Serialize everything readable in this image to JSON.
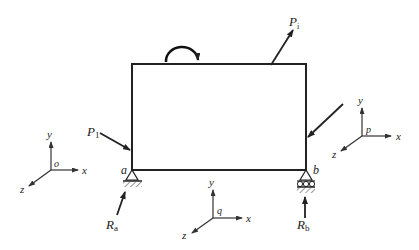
{
  "diagram": {
    "type": "free-body diagram of a rigid body with supports and coordinate frames",
    "body": {
      "shape": "rectangle",
      "corner_labels": {
        "bottom_left": "a",
        "bottom_right": "b"
      }
    },
    "forces": [
      {
        "id": "P1",
        "label": "P",
        "subscript": "1",
        "position": "left side near bottom"
      },
      {
        "id": "Pi",
        "label": "P",
        "subscript": "i",
        "position": "top edge, pointing up-right"
      },
      {
        "id": "unnamed",
        "label": "",
        "position": "right side, pointing down-left"
      },
      {
        "id": "Ra",
        "label": "R",
        "subscript": "a",
        "position": "below support a"
      },
      {
        "id": "Rb",
        "label": "R",
        "subscript": "b",
        "position": "below support b"
      }
    ],
    "moment": {
      "direction": "clockwise",
      "position": "above top edge"
    },
    "supports": [
      {
        "at": "a",
        "type": "pin"
      },
      {
        "at": "b",
        "type": "roller"
      }
    ],
    "frames": [
      {
        "origin": "o",
        "axes": [
          "x",
          "y",
          "z"
        ],
        "position": "left"
      },
      {
        "origin": "q",
        "axes": [
          "x",
          "y",
          "z"
        ],
        "position": "bottom center"
      },
      {
        "origin": "p",
        "axes": [
          "x",
          "y",
          "z"
        ],
        "position": "right"
      }
    ]
  },
  "colors": {
    "line": "#222222",
    "background": "#ffffff"
  }
}
